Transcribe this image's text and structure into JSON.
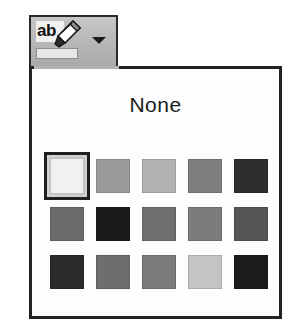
{
  "toolbar": {
    "button_name": "Text Highlight Color",
    "icon_label": "ab",
    "icon_name": "highlighter-pen-icon",
    "dropdown_arrow_name": "chevron-down-icon",
    "current_color": "#e8e8e8",
    "button_background": "#b4b4b4"
  },
  "panel": {
    "title": "None",
    "border_color": "#232323",
    "background": "#fdfdfd",
    "columns": 5,
    "rows": 3,
    "selected_index": 0,
    "swatches": [
      {
        "index": 0,
        "color": "#f1f1f1",
        "selected": true,
        "row": 1,
        "col": 1
      },
      {
        "index": 1,
        "color": "#9a9a9a",
        "selected": false,
        "row": 1,
        "col": 2
      },
      {
        "index": 2,
        "color": "#b2b2b2",
        "selected": false,
        "row": 1,
        "col": 3
      },
      {
        "index": 3,
        "color": "#7e7e7e",
        "selected": false,
        "row": 1,
        "col": 4
      },
      {
        "index": 4,
        "color": "#2e2e2e",
        "selected": false,
        "row": 1,
        "col": 5
      },
      {
        "index": 5,
        "color": "#6a6a6a",
        "selected": false,
        "row": 2,
        "col": 1
      },
      {
        "index": 6,
        "color": "#1a1a1a",
        "selected": false,
        "row": 2,
        "col": 2
      },
      {
        "index": 7,
        "color": "#6f6f6f",
        "selected": false,
        "row": 2,
        "col": 3
      },
      {
        "index": 8,
        "color": "#7c7c7c",
        "selected": false,
        "row": 2,
        "col": 4
      },
      {
        "index": 9,
        "color": "#565656",
        "selected": false,
        "row": 2,
        "col": 5
      },
      {
        "index": 10,
        "color": "#2b2b2b",
        "selected": false,
        "row": 3,
        "col": 1
      },
      {
        "index": 11,
        "color": "#6e6e6e",
        "selected": false,
        "row": 3,
        "col": 2
      },
      {
        "index": 12,
        "color": "#7b7b7b",
        "selected": false,
        "row": 3,
        "col": 3
      },
      {
        "index": 13,
        "color": "#c4c4c4",
        "selected": false,
        "row": 3,
        "col": 4
      },
      {
        "index": 14,
        "color": "#1c1c1c",
        "selected": false,
        "row": 3,
        "col": 5
      }
    ]
  }
}
